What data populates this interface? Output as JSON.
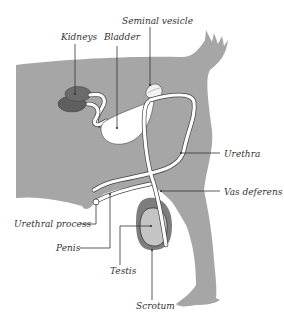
{
  "colors": {
    "body": "#a6a6a6",
    "kidney": "#6b6b6b",
    "scrotum": "#7d7d7d",
    "testis": "#c4c4c4",
    "organ": "#ffffff",
    "label_text": "#333333"
  },
  "labels": {
    "kidneys": "Kidneys",
    "bladder": "Bladder",
    "seminal_vesicle": "Seminal vesicle",
    "urethra": "Urethra",
    "vas_deferens": "Vas deferens",
    "urethral_process": "Urethral process",
    "penis": "Penis",
    "testis": "Testis",
    "scrotum": "Scrotum"
  }
}
